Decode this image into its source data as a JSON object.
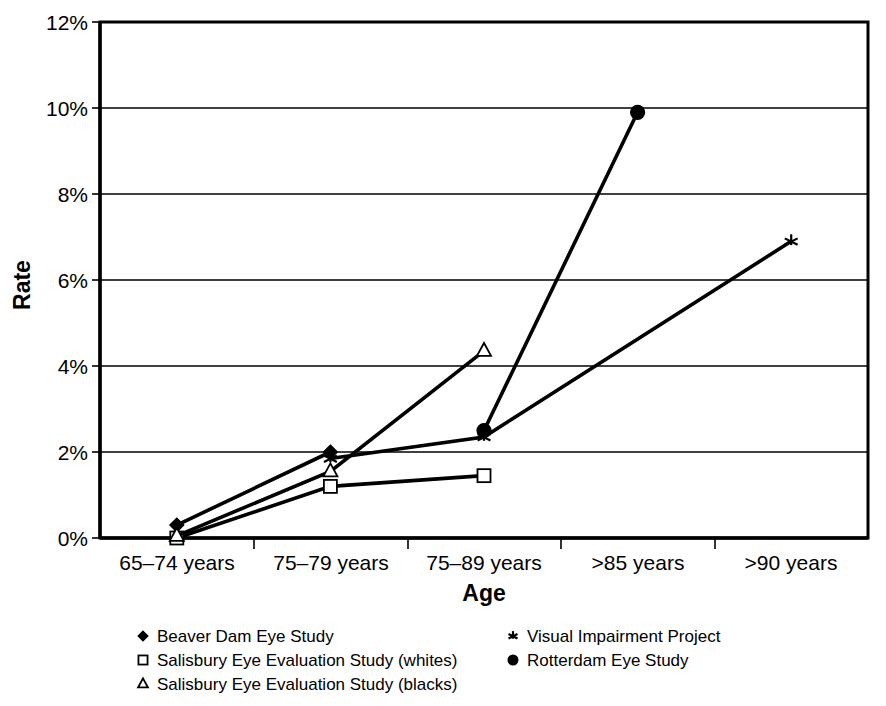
{
  "chart_data": {
    "type": "line",
    "title": "",
    "xlabel": "Age",
    "ylabel": "Rate",
    "categories": [
      "65–74 years",
      "75–79 years",
      "75–89 years",
      ">85 years",
      ">90 years"
    ],
    "ylim": [
      0,
      12
    ],
    "ytick_labels": [
      "0%",
      "2%",
      "4%",
      "6%",
      "8%",
      "10%",
      "12%"
    ],
    "ytick_values": [
      0,
      2,
      4,
      6,
      8,
      10,
      12
    ],
    "grid": "horizontal",
    "legend_position": "bottom",
    "series": [
      {
        "name": "Beaver Dam Eye Study",
        "marker": "filled-diamond",
        "points": [
          {
            "x": "65–74 years",
            "y": 0.3
          },
          {
            "x": "75–79 years",
            "y": 2.0
          }
        ]
      },
      {
        "name": "Salisbury Eye Evaluation Study (whites)",
        "marker": "hollow-square",
        "points": [
          {
            "x": "65–74 years",
            "y": 0.0
          },
          {
            "x": "75–79 years",
            "y": 1.2
          },
          {
            "x": "75–89 years",
            "y": 1.45
          }
        ]
      },
      {
        "name": "Salisbury Eye Evaluation Study (blacks)",
        "marker": "hollow-triangle",
        "points": [
          {
            "x": "65–74 years",
            "y": 0.05
          },
          {
            "x": "75–79 years",
            "y": 1.55
          },
          {
            "x": "75–89 years",
            "y": 4.35
          }
        ]
      },
      {
        "name": "Visual Impairment Project",
        "marker": "star",
        "points": [
          {
            "x": "75–79 years",
            "y": 1.85
          },
          {
            "x": "75–89 years",
            "y": 2.35
          },
          {
            "x": ">90 years",
            "y": 6.9
          }
        ]
      },
      {
        "name": "Rotterdam Eye Study",
        "marker": "filled-circle",
        "points": [
          {
            "x": "75–89 years",
            "y": 2.5
          },
          {
            "x": ">85 years",
            "y": 9.9
          }
        ]
      }
    ],
    "colors": {
      "line": "#000000",
      "grid": "#000000",
      "background": "#ffffff"
    }
  },
  "legend": {
    "column_left": [
      {
        "label": "Beaver Dam Eye Study",
        "marker": "filled-diamond"
      },
      {
        "label": "Salisbury Eye Evaluation Study (whites)",
        "marker": "hollow-square"
      },
      {
        "label": "Salisbury Eye Evaluation Study (blacks)",
        "marker": "hollow-triangle"
      }
    ],
    "column_right": [
      {
        "label": "Visual Impairment Project",
        "marker": "star"
      },
      {
        "label": "Rotterdam Eye Study",
        "marker": "filled-circle"
      }
    ]
  },
  "axes": {
    "y_title": "Rate",
    "x_title": "Age",
    "y_ticks": [
      "12%",
      "10%",
      "8%",
      "6%",
      "4%",
      "2%",
      "0%"
    ],
    "x_ticks": [
      "65–74 years",
      "75–79 years",
      "75–89 years",
      ">85 years",
      ">90 years"
    ]
  }
}
